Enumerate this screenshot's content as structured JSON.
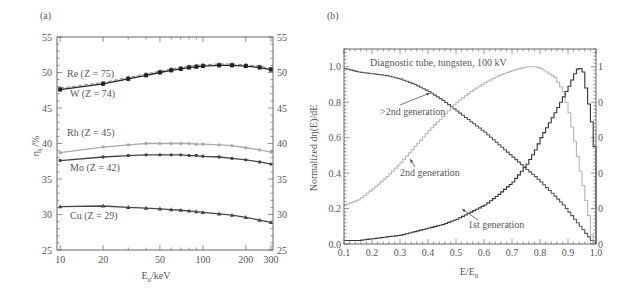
{
  "chart_data": [
    {
      "panel": "(a)",
      "type": "line",
      "title": "",
      "xlabel": "E0/keV",
      "ylabel": "ηL/%",
      "xscale": "log",
      "xlim": [
        9.5,
        310
      ],
      "ylim": [
        25,
        55
      ],
      "xticks": [
        10,
        20,
        50,
        100,
        200,
        300
      ],
      "yticks": [
        25,
        30,
        35,
        40,
        45,
        50,
        55
      ],
      "right_axis_ticks": [
        25,
        30,
        35,
        40,
        45,
        50,
        55
      ],
      "grid": false,
      "x": [
        10,
        20,
        30,
        40,
        50,
        60,
        70,
        80,
        90,
        100,
        130,
        160,
        200,
        250,
        300
      ],
      "series": [
        {
          "name": "Re (Z = 75)",
          "label": "Re (Z = 75)",
          "color": "#888888",
          "dash": true,
          "marker": "circle",
          "values": [
            47.8,
            48.6,
            49.3,
            49.8,
            50.2,
            50.5,
            50.7,
            50.9,
            51.0,
            51.1,
            51.2,
            51.2,
            51.1,
            50.9,
            50.6
          ]
        },
        {
          "name": "W (Z = 74)",
          "label": "W (Z = 74)",
          "color": "#222222",
          "dash": false,
          "marker": "square",
          "values": [
            47.6,
            48.4,
            49.1,
            49.6,
            50.0,
            50.3,
            50.5,
            50.7,
            50.8,
            50.9,
            51.0,
            51.0,
            50.9,
            50.7,
            50.4
          ]
        },
        {
          "name": "Rh (Z = 45)",
          "label": "Rh (Z = 45)",
          "color": "#aaaaaa",
          "dash": false,
          "marker": "circle",
          "values": [
            38.7,
            39.5,
            39.8,
            40.0,
            40.0,
            40.0,
            40.0,
            40.0,
            39.9,
            39.9,
            39.8,
            39.7,
            39.4,
            39.1,
            38.8
          ]
        },
        {
          "name": "Mo (Z = 42)",
          "label": "Mo (Z = 42)",
          "color": "#444444",
          "dash": false,
          "marker": "circle",
          "values": [
            37.6,
            38.1,
            38.3,
            38.4,
            38.4,
            38.4,
            38.4,
            38.3,
            38.3,
            38.2,
            38.1,
            37.9,
            37.7,
            37.4,
            37.1
          ]
        },
        {
          "name": "Cu (Z = 29)",
          "label": "Cu (Z = 29)",
          "color": "#444444",
          "dash": false,
          "marker": "triangle",
          "values": [
            31.1,
            31.2,
            31.0,
            30.9,
            30.8,
            30.7,
            30.6,
            30.5,
            30.4,
            30.3,
            30.1,
            29.9,
            29.6,
            29.2,
            28.9
          ]
        }
      ]
    },
    {
      "panel": "(b)",
      "type": "line",
      "title": "Diagnostic tube, tungsten, 100 kV",
      "xlabel": "E/E0",
      "ylabel": "Normalized dη(E)/dE",
      "xlim": [
        0.1,
        1.0
      ],
      "ylim": [
        0.0,
        1.1
      ],
      "xticks": [
        0.1,
        0.2,
        0.3,
        0.4,
        0.5,
        0.6,
        0.7,
        0.8,
        0.9,
        1.0
      ],
      "yticks": [
        0.0,
        0.2,
        0.4,
        0.6,
        0.8,
        1.0
      ],
      "right_axis_ticks": [
        "0",
        "0",
        "0",
        "0",
        "0",
        "1"
      ],
      "grid": false,
      "step": true,
      "x": [
        0.1,
        0.15,
        0.2,
        0.25,
        0.3,
        0.35,
        0.4,
        0.45,
        0.5,
        0.55,
        0.6,
        0.65,
        0.7,
        0.75,
        0.78,
        0.8,
        0.85,
        0.88,
        0.9,
        0.92,
        0.935,
        0.95,
        0.97,
        0.98,
        0.99,
        1.0
      ],
      "series": [
        {
          "name": ">2nd generation",
          "color": "#555555",
          "values": [
            0.99,
            0.97,
            0.96,
            0.95,
            0.93,
            0.9,
            0.86,
            0.81,
            0.75,
            0.69,
            0.63,
            0.56,
            0.49,
            0.42,
            0.38,
            0.35,
            0.27,
            0.22,
            0.18,
            0.14,
            0.11,
            0.08,
            0.04,
            0.02,
            0.01,
            0.0
          ]
        },
        {
          "name": "2nd generation",
          "color": "#b5b5b5",
          "values": [
            0.22,
            0.25,
            0.31,
            0.38,
            0.46,
            0.55,
            0.64,
            0.72,
            0.8,
            0.86,
            0.91,
            0.95,
            0.98,
            1.0,
            1.0,
            0.99,
            0.94,
            0.86,
            0.74,
            0.58,
            0.45,
            0.33,
            0.16,
            0.05,
            0.01,
            0.0
          ]
        },
        {
          "name": "1st generation",
          "color": "#333333",
          "values": [
            0.02,
            0.02,
            0.03,
            0.04,
            0.05,
            0.07,
            0.09,
            0.11,
            0.14,
            0.18,
            0.22,
            0.28,
            0.35,
            0.45,
            0.53,
            0.6,
            0.74,
            0.83,
            0.89,
            0.96,
            1.0,
            0.97,
            0.79,
            0.69,
            0.55,
            0.0
          ]
        }
      ],
      "annotations": [
        ">2nd generation",
        "2nd generation",
        "1st generation"
      ]
    }
  ],
  "panels": {
    "a": {
      "label": "(a)",
      "xlabel": "E",
      "xlabel_sub": "0",
      "xlabel_unit": "/keV",
      "ylabel": "η",
      "ylabel_sub": "L",
      "ylabel_unit": "/%",
      "x_tick_labels": [
        "10",
        "20",
        "50",
        "100",
        "200",
        "300"
      ],
      "y_tick_labels": [
        "25",
        "30",
        "35",
        "40",
        "45",
        "50",
        "55"
      ],
      "series_labels": [
        "Re (Z = 75)",
        "W (Z = 74)",
        "Rh (Z = 45)",
        "Mo (Z = 42)",
        "Cu (Z = 29)"
      ]
    },
    "b": {
      "label": "(b)",
      "title": "Diagnostic tube, tungsten, 100 kV",
      "xlabel": "E/E",
      "xlabel_sub": "0",
      "ylabel": "Normalized dη(E)/dE",
      "x_tick_labels": [
        "0.1",
        "0.2",
        "0.3",
        "0.4",
        "0.5",
        "0.6",
        "0.7",
        "0.8",
        "0.9",
        "1.0"
      ],
      "y_tick_labels": [
        "0.0",
        "0.2",
        "0.4",
        "0.6",
        "0.8",
        "1.0"
      ],
      "right_tick_labels": [
        "0",
        "0",
        "0",
        "0",
        "0",
        "1"
      ],
      "annotations": [
        ">2nd generation",
        "2nd generation",
        "1st generation"
      ]
    }
  }
}
